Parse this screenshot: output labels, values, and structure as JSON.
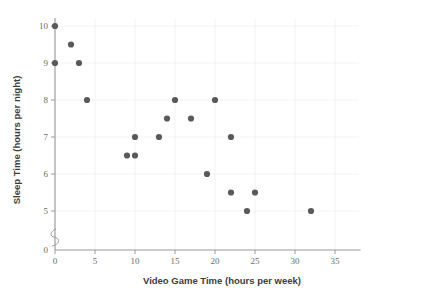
{
  "chart_data": {
    "type": "scatter",
    "title": "",
    "xlabel": "Video Game Time (hours per week)",
    "ylabel": "Sleep Time (hours per night)",
    "xlim": [
      0,
      38
    ],
    "ylim": [
      0,
      10.4
    ],
    "xticks": [
      0,
      5,
      10,
      15,
      20,
      25,
      30,
      35
    ],
    "xtick_labels": [
      "0",
      "5",
      "10",
      "15",
      "20",
      "25",
      "30",
      "35"
    ],
    "yticks": [
      0,
      5,
      6,
      7,
      8,
      9,
      10
    ],
    "ytick_labels": [
      "0",
      "5",
      "6",
      "7",
      "8",
      "9",
      "10"
    ],
    "y_axis_break": true,
    "y_axis_break_between": [
      0,
      5
    ],
    "grid": "light",
    "legend": "none",
    "marker_color": "#5a5a5a",
    "marker_size": 3.1,
    "points": [
      {
        "x": 0,
        "y": 10
      },
      {
        "x": 0,
        "y": 9
      },
      {
        "x": 2,
        "y": 9.5
      },
      {
        "x": 3,
        "y": 9
      },
      {
        "x": 4,
        "y": 8
      },
      {
        "x": 9,
        "y": 6.5
      },
      {
        "x": 10,
        "y": 6.5
      },
      {
        "x": 10,
        "y": 7
      },
      {
        "x": 13,
        "y": 7
      },
      {
        "x": 14,
        "y": 7.5
      },
      {
        "x": 15,
        "y": 8
      },
      {
        "x": 17,
        "y": 7.5
      },
      {
        "x": 19,
        "y": 6
      },
      {
        "x": 20,
        "y": 8
      },
      {
        "x": 22,
        "y": 7
      },
      {
        "x": 22,
        "y": 5.5
      },
      {
        "x": 24,
        "y": 5
      },
      {
        "x": 25,
        "y": 5.5
      },
      {
        "x": 32,
        "y": 5
      }
    ]
  },
  "colors": {
    "marker": "#5a5a5a",
    "axis": "#9a9a9a",
    "grid": "#f0f0f0",
    "tick_text": "#6b6b6b",
    "title_text": "#3d3d3d",
    "background": "#ffffff"
  }
}
